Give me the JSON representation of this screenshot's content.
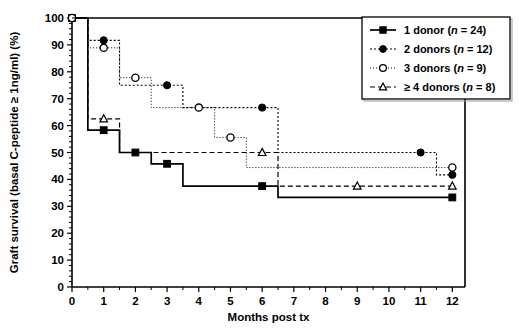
{
  "chart_data": {
    "type": "line",
    "title": "",
    "xlabel": "Months post tx",
    "ylabel": "Graft survival (basal C-peptide ≥ 1ng/ml) (%)",
    "xlim": [
      0,
      12.4
    ],
    "ylim": [
      0,
      100
    ],
    "xticks": [
      0,
      1,
      2,
      3,
      4,
      5,
      6,
      7,
      8,
      9,
      10,
      11,
      12
    ],
    "xticklabels": [
      "0",
      "1",
      "2",
      "3",
      "4",
      "5",
      "6",
      "7",
      "8",
      "9",
      "10",
      "11",
      "12"
    ],
    "yticks": [
      0,
      10,
      20,
      30,
      40,
      50,
      60,
      70,
      80,
      90,
      100
    ],
    "yticklabels": [
      "0",
      "10",
      "20",
      "30",
      "40",
      "50",
      "60",
      "70",
      "80",
      "90",
      "100"
    ],
    "grid": false,
    "legend_position": "top-right",
    "plot_style": "step-post (Kaplan-Meier survival curves)",
    "series": [
      {
        "name": "1 donor (n = 24)",
        "label_main": "1 donor",
        "label_n": "(n = 24)",
        "n": 24,
        "marker": "filled-square",
        "linestyle": "solid",
        "color": "#000000",
        "steps": [
          {
            "x": 0,
            "y": 100
          },
          {
            "x": 0.5,
            "y": 58.3
          },
          {
            "x": 1.5,
            "y": 50.0
          },
          {
            "x": 2.5,
            "y": 45.8
          },
          {
            "x": 3.5,
            "y": 37.5
          },
          {
            "x": 6.5,
            "y": 33.3
          },
          {
            "x": 12.0,
            "y": 33.3
          }
        ],
        "markers": [
          {
            "x": 0,
            "y": 100
          },
          {
            "x": 1,
            "y": 58.3
          },
          {
            "x": 2,
            "y": 50.0
          },
          {
            "x": 3,
            "y": 45.8
          },
          {
            "x": 6,
            "y": 37.5
          },
          {
            "x": 12,
            "y": 33.3
          }
        ]
      },
      {
        "name": "2 donors (n = 12)",
        "label_main": "2 donors",
        "label_n": "(n = 12)",
        "n": 12,
        "marker": "filled-circle",
        "linestyle": "dashed-fine",
        "color": "#000000",
        "steps": [
          {
            "x": 0,
            "y": 100
          },
          {
            "x": 0.5,
            "y": 91.7
          },
          {
            "x": 1.5,
            "y": 75.0
          },
          {
            "x": 3.5,
            "y": 66.7
          },
          {
            "x": 6.5,
            "y": 50.0
          },
          {
            "x": 11.5,
            "y": 41.7
          },
          {
            "x": 12.0,
            "y": 41.7
          }
        ],
        "markers": [
          {
            "x": 1,
            "y": 91.7
          },
          {
            "x": 3,
            "y": 75.0
          },
          {
            "x": 6,
            "y": 66.7
          },
          {
            "x": 11,
            "y": 50.0
          },
          {
            "x": 12,
            "y": 41.7
          }
        ]
      },
      {
        "name": "3 donors (n = 9)",
        "label_main": "3 donors",
        "label_n": "(n = 9)",
        "n": 9,
        "marker": "open-circle",
        "linestyle": "dotted",
        "color": "#000000",
        "steps": [
          {
            "x": 0,
            "y": 100
          },
          {
            "x": 0.5,
            "y": 88.9
          },
          {
            "x": 1.5,
            "y": 77.8
          },
          {
            "x": 2.5,
            "y": 66.7
          },
          {
            "x": 4.5,
            "y": 55.6
          },
          {
            "x": 5.5,
            "y": 44.4
          },
          {
            "x": 12.0,
            "y": 44.4
          }
        ],
        "markers": [
          {
            "x": 0,
            "y": 100
          },
          {
            "x": 1,
            "y": 88.9
          },
          {
            "x": 2,
            "y": 77.8
          },
          {
            "x": 4,
            "y": 66.7
          },
          {
            "x": 5,
            "y": 55.6
          },
          {
            "x": 12,
            "y": 44.4
          }
        ]
      },
      {
        "name": "≥ 4 donors (n = 8)",
        "label_main": "≥ 4 donors",
        "label_n": "(n = 8)",
        "n": 8,
        "marker": "open-triangle",
        "linestyle": "dashed",
        "color": "#000000",
        "steps": [
          {
            "x": 0,
            "y": 100
          },
          {
            "x": 0.5,
            "y": 62.5
          },
          {
            "x": 1.5,
            "y": 50.0
          },
          {
            "x": 6.5,
            "y": 37.5
          },
          {
            "x": 12.0,
            "y": 37.5
          }
        ],
        "markers": [
          {
            "x": 1,
            "y": 62.5
          },
          {
            "x": 6,
            "y": 50.0
          },
          {
            "x": 9,
            "y": 37.5
          },
          {
            "x": 12,
            "y": 37.5
          }
        ]
      }
    ]
  },
  "legend": {
    "entries": [
      {
        "label": "1 donor (n = 24)"
      },
      {
        "label": "2 donors (n = 12)"
      },
      {
        "label": "3 donors (n = 9)"
      },
      {
        "label": "≥ 4 donors (n = 8)"
      }
    ]
  },
  "axes": {
    "x_title": "Months post tx",
    "y_title": "Graft survival (basal C-peptide ≥ 1ng/ml) (%)"
  },
  "colors": {
    "ink": "#000000",
    "background": "#ffffff",
    "frame": "#000000"
  }
}
